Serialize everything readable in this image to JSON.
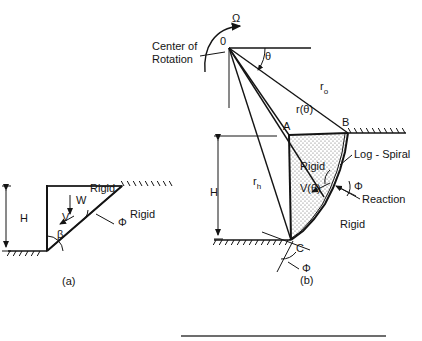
{
  "figure": {
    "type": "engineering-diagram",
    "background_color": "#ffffff",
    "line_color": "#141414",
    "fill_color": "#e8e8e8"
  },
  "panel_a": {
    "caption": "(a)",
    "caption_pos": {
      "x": 62,
      "y": 285
    },
    "labels": {
      "height": "H",
      "weight": "W",
      "velocity": "V",
      "beta": "β",
      "phi": "Φ",
      "rigid_upper": "Rigid",
      "rigid_lower": "Rigid"
    },
    "label_pos": {
      "height": {
        "x": 20,
        "y": 222
      },
      "weight": {
        "x": 76,
        "y": 204
      },
      "velocity": {
        "x": 62,
        "y": 221
      },
      "beta": {
        "x": 57,
        "y": 238
      },
      "phi": {
        "x": 118,
        "y": 226
      },
      "rigid_upper": {
        "x": 90,
        "y": 192
      },
      "rigid_lower": {
        "x": 130,
        "y": 218
      }
    },
    "geometry": {
      "wall_x": 47,
      "crest_y": 186,
      "toe_y": 251,
      "slope_top_x": 122,
      "surface_right_x": 172,
      "ground_left_x": 8,
      "dim_x": 6,
      "dim_top_y": 186,
      "dim_bot_y": 251,
      "weight_arrow": {
        "x": 70,
        "y1": 195,
        "y2": 214
      },
      "velocity_arrow": {
        "x1": 74,
        "y1": 216,
        "x2": 60,
        "y2": 224
      },
      "phi_leader": {
        "x1": 114,
        "y1": 224,
        "x2": 96,
        "y2": 214
      }
    }
  },
  "panel_b": {
    "caption": "(b)",
    "caption_pos": {
      "x": 300,
      "y": 284
    },
    "labels": {
      "omega": "Ω",
      "center_of_rotation_line1": "Center of",
      "center_of_rotation_line2": "Rotation",
      "origin": "0",
      "theta": "θ",
      "r_zero": "r",
      "r_zero_sub": "o",
      "r_theta": "r(θ)",
      "r_h": "r",
      "r_h_sub": "h",
      "point_a": "A",
      "point_b": "B",
      "point_c": "C",
      "height": "H",
      "rigid_inner": "Rigid",
      "rigid_outer": "Rigid",
      "velocity": "V(θ)",
      "log_spiral": "Log - Spiral",
      "reaction": "Reaction",
      "phi_right": "Φ",
      "phi_bottom": "Φ"
    },
    "label_pos": {
      "omega": {
        "x": 232,
        "y": 22
      },
      "center_of_rotation_line1": {
        "x": 152,
        "y": 50
      },
      "center_of_rotation_line2": {
        "x": 152,
        "y": 63
      },
      "origin": {
        "x": 220,
        "y": 45
      },
      "theta": {
        "x": 265,
        "y": 60
      },
      "r_zero": {
        "x": 320,
        "y": 90
      },
      "r_theta": {
        "x": 296,
        "y": 113
      },
      "r_h": {
        "x": 253,
        "y": 185
      },
      "point_a": {
        "x": 283,
        "y": 130
      },
      "point_b": {
        "x": 342,
        "y": 126
      },
      "point_c": {
        "x": 296,
        "y": 252
      },
      "height": {
        "x": 210,
        "y": 196
      },
      "rigid_inner": {
        "x": 300,
        "y": 170
      },
      "rigid_outer": {
        "x": 340,
        "y": 228
      },
      "velocity": {
        "x": 300,
        "y": 192
      },
      "log_spiral": {
        "x": 354,
        "y": 158
      },
      "reaction": {
        "x": 362,
        "y": 203
      },
      "phi_right": {
        "x": 354,
        "y": 190
      },
      "phi_bottom": {
        "x": 302,
        "y": 272
      }
    },
    "geometry": {
      "origin": {
        "x": 229,
        "y": 48
      },
      "point_a": {
        "x": 289,
        "y": 135
      },
      "point_b": {
        "x": 348,
        "y": 133
      },
      "point_c": {
        "x": 291,
        "y": 240
      },
      "horizontal_ref_x2": 311,
      "ground_y": 240,
      "ground_left_x": 214,
      "surface_right_x": 406,
      "dim_x": 218,
      "dim_top_y": 136,
      "dim_bot_y": 239,
      "vertical_drop_y2": 108,
      "theta_arc_r": 36,
      "spiral_points": "348,133 345,152 340,170 333,188 325,204 314,219 303,231 291,240"
    }
  },
  "rule": {
    "x1": 181,
    "x2": 386,
    "y": 336,
    "color": "#3d3d3d"
  }
}
